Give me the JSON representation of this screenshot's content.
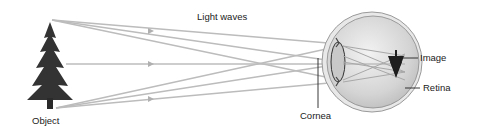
{
  "diagram": {
    "title": "Light waves",
    "labels": {
      "object": "Object",
      "light_waves": "Light waves",
      "cornea": "Cornea",
      "image": "Image",
      "retina": "Retina"
    },
    "colors": {
      "rays": "#b8b8b8",
      "eye_fill": "#d6d6d6",
      "eye_outline": "#888888",
      "tree": "#2f2f2f",
      "text": "#222222"
    }
  }
}
